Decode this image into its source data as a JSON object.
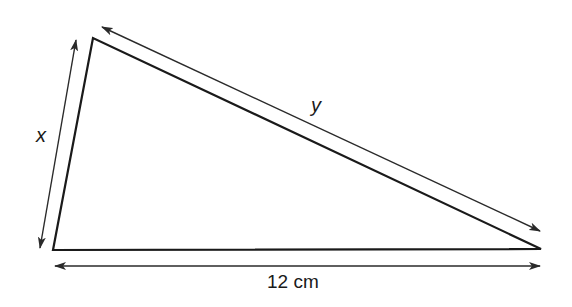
{
  "figure": {
    "type": "triangle",
    "stroke_color": "#1a1a1a",
    "arrow_color": "#2a2a2a",
    "vertices": {
      "top": [
        93,
        38
      ],
      "bottom_left": [
        53,
        250
      ],
      "right": [
        541,
        249
      ]
    }
  },
  "labels": {
    "left_side": "x",
    "hypotenuse": "y",
    "base": "12 cm"
  },
  "dimensions": [
    {
      "side": "left",
      "label": "x",
      "from": [
        76,
        40
      ],
      "to": [
        40,
        248
      ]
    },
    {
      "side": "hypotenuse",
      "label": "y",
      "from": [
        102,
        27
      ],
      "to": [
        540,
        231
      ]
    },
    {
      "side": "base",
      "label": "12 cm",
      "from": [
        55,
        266
      ],
      "to": [
        540,
        266
      ]
    }
  ]
}
